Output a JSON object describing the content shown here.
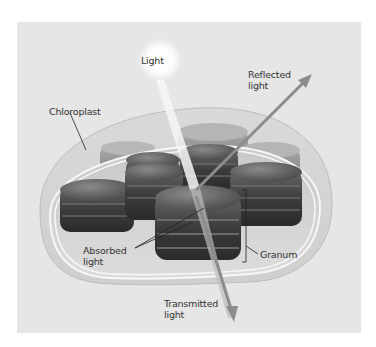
{
  "labels": {
    "light": "Light",
    "reflected": "Reflected\nlight",
    "chloroplast": "Chloroplast",
    "absorbed": "Absorbed\nlight",
    "granum": "Granum",
    "transmitted": "Transmitted\nlight"
  },
  "colors": {
    "panel_bg": "#e6e6e6",
    "granum": "#4a4a4a",
    "arrow": "#8c8c8c",
    "beam": "#f4f4f4",
    "text": "#333333"
  }
}
